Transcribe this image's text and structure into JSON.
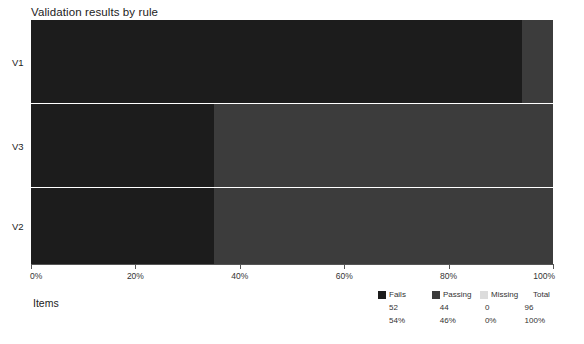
{
  "chart_data": {
    "type": "bar",
    "title": "Validation results by rule",
    "xlabel": "Items",
    "ylabel": "",
    "orientation": "horizontal",
    "stacked": true,
    "normalized": true,
    "grid": false,
    "legend_position": "bottom-right",
    "xlim": [
      0,
      100
    ],
    "categories": [
      "V1",
      "V3",
      "V2"
    ],
    "tick_labels": [
      "0%",
      "20%",
      "40%",
      "60%",
      "80%",
      "100%"
    ],
    "tick_values": [
      0,
      20,
      40,
      60,
      80,
      100
    ],
    "series": [
      {
        "name": "Fails",
        "color": "#1c1c1c",
        "values": [
          94,
          35,
          35
        ]
      },
      {
        "name": "Passing",
        "color": "#3c3c3c",
        "values": [
          6,
          65,
          65
        ]
      },
      {
        "name": "Missing",
        "color": "#dcdcdc",
        "values": [
          0,
          0,
          0
        ]
      }
    ],
    "summary": {
      "headers": [
        "Fails",
        "Passing",
        "Missing",
        "Total"
      ],
      "counts": [
        "52",
        "44",
        "0",
        "96"
      ],
      "percents": [
        "54%",
        "46%",
        "0%",
        "100%"
      ]
    }
  },
  "colors": {
    "fails": "#1c1c1c",
    "passing": "#3c3c3c",
    "missing": "#dcdcdc",
    "total_swatch": "#ffffff",
    "axis": "#555555",
    "background": "#ffffff",
    "divider": "#e8e8e8"
  }
}
